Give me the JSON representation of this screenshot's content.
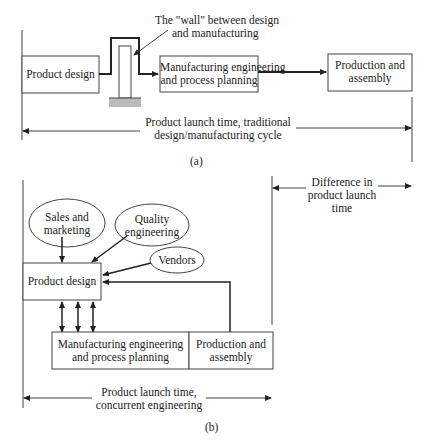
{
  "diagram_a": {
    "wall_label_line1": "The \"wall\" between design",
    "wall_label_line2": "and manufacturing",
    "boxes": {
      "product_design": "Product design",
      "mfg_line1": "Manufacturing engineering",
      "mfg_line2": "and process planning",
      "prod_line1": "Production and",
      "prod_line2": "assembly"
    },
    "launch_line1": "Product launch time, traditional",
    "launch_line2": "design/manufacturing cycle",
    "caption": "(a)"
  },
  "difference": {
    "line1": "Difference in",
    "line2": "product launch",
    "line3": "time"
  },
  "diagram_b": {
    "ellipses": {
      "sales_line1": "Sales and",
      "sales_line2": "marketing",
      "quality_line1": "Quality",
      "quality_line2": "engineering",
      "vendors": "Vendors"
    },
    "boxes": {
      "product_design": "Product design",
      "mfg_line1": "Manufacturing engineering",
      "mfg_line2": "and process planning",
      "prod_line1": "Production and",
      "prod_line2": "assembly"
    },
    "launch_line1": "Product launch time,",
    "launch_line2": "concurrent engineering",
    "caption": "(b)"
  }
}
